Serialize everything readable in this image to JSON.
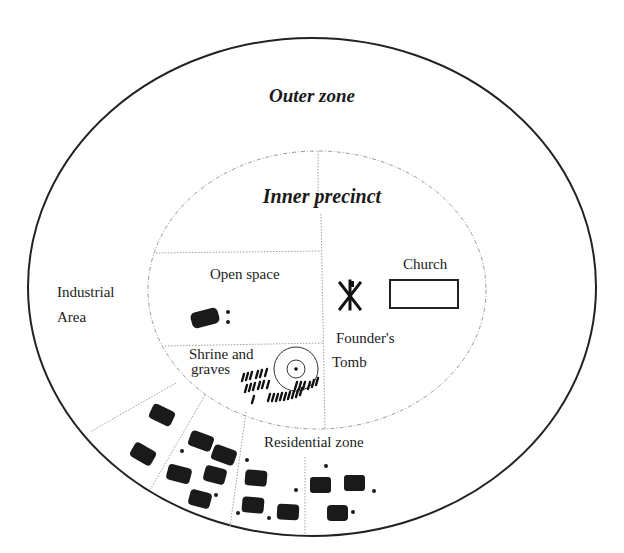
{
  "diagram": {
    "zones": {
      "outer": "Outer zone",
      "inner": "Inner precinct"
    },
    "labels": {
      "open_space": "Open space",
      "industrial_line1": "Industrial",
      "industrial_line2": "Area",
      "church": "Church",
      "founders_tomb_line1": "Founder's",
      "founders_tomb_line2": "Tomb",
      "shrine_line1": "Shrine and",
      "shrine_line2": "graves",
      "residential": "Residential zone"
    },
    "colors": {
      "outline": "#222222",
      "divider": "#9a9a9a",
      "building": "#1a1a1a",
      "background": "#ffffff"
    },
    "icons": {
      "chi_rho": "chi-rho-symbol",
      "church": "rectangle-outline",
      "shrine": "concentric-circles",
      "house": "rounded-black-block"
    }
  }
}
